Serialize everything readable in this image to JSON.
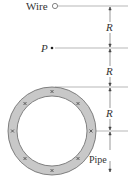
{
  "labels": {
    "wire": "Wire",
    "point": "P",
    "pipe": "Pipe",
    "dim1": "R",
    "dim2": "R",
    "dim3": "R"
  },
  "colors": {
    "pipe_fill": "#c8c8c8",
    "line": "#666666",
    "text": "#333333",
    "background": "#ffffff"
  },
  "pipe": {
    "current_marks": 8,
    "current_direction": "into-page"
  }
}
